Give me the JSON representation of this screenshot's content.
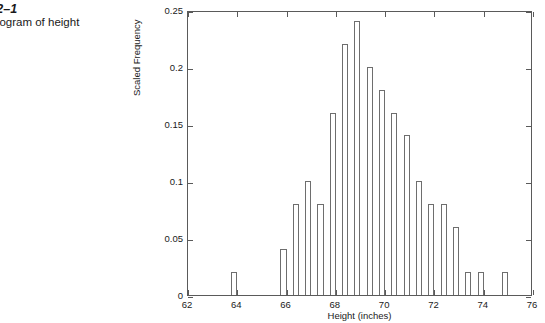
{
  "caption": {
    "figure_number": "ure 7.2–1",
    "description_line1": "led histogram of height",
    "description_line2": "a."
  },
  "chart_data": {
    "type": "bar",
    "title": "",
    "xlabel": "Height (inches)",
    "ylabel": "Scaled Frequency",
    "xlim": [
      62,
      76
    ],
    "ylim": [
      0,
      0.25
    ],
    "xticks": [
      62,
      64,
      66,
      68,
      70,
      72,
      74,
      76
    ],
    "xtick_labels": [
      "62",
      "64",
      "66",
      "68",
      "70",
      "72",
      "74",
      "76"
    ],
    "yticks": [
      0,
      0.05,
      0.1,
      0.15,
      0.2,
      0.25
    ],
    "ytick_labels": [
      "0",
      "0.05",
      "0.1",
      "0.15",
      "0.2",
      "0.25"
    ],
    "grid": false,
    "legend": null,
    "bar_width": 0.25,
    "x": [
      63.875,
      65.875,
      66.375,
      66.875,
      67.375,
      67.875,
      68.375,
      68.875,
      69.375,
      69.875,
      70.375,
      70.875,
      71.375,
      71.875,
      72.375,
      72.875,
      73.375,
      73.875,
      74.875
    ],
    "values": [
      0.02,
      0.04,
      0.08,
      0.1,
      0.08,
      0.16,
      0.22,
      0.24,
      0.2,
      0.18,
      0.16,
      0.14,
      0.1,
      0.08,
      0.08,
      0.06,
      0.02,
      0.02,
      0.02
    ]
  }
}
